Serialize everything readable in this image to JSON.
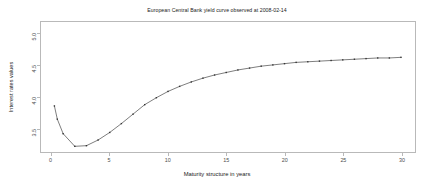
{
  "chart_data": {
    "type": "line",
    "title": "European Central Bank yield curve observed at 2008-02-14",
    "xlabel": "Maturity structure in years",
    "ylabel": "Interest rates values",
    "xlim": [
      -0.9,
      31.2
    ],
    "ylim": [
      3.12,
      5.18
    ],
    "xticks": [
      0,
      5,
      10,
      15,
      20,
      25,
      30
    ],
    "xticklabels": [
      "0",
      "5",
      "10",
      "15",
      "20",
      "25",
      "30"
    ],
    "yticks": [
      3.5,
      4.0,
      4.5,
      5.0
    ],
    "yticklabels": [
      "3.5",
      "4.0",
      "4.5",
      "5.0"
    ],
    "grid": false,
    "legend": false,
    "marker": "point",
    "line_color": "#444444",
    "marker_color": "#333333",
    "panel_border_color": "#b9b9b9",
    "background": "#ffffff",
    "series": [
      {
        "name": "yield curve",
        "x": [
          0.25,
          0.5,
          1,
          2,
          3,
          4,
          5,
          6,
          7,
          8,
          9,
          10,
          11,
          12,
          13,
          14,
          15,
          16,
          17,
          18,
          19,
          20,
          21,
          22,
          23,
          24,
          25,
          26,
          27,
          28,
          29,
          30
        ],
        "y": [
          3.85,
          3.64,
          3.41,
          3.21,
          3.22,
          3.31,
          3.43,
          3.57,
          3.72,
          3.87,
          3.98,
          4.08,
          4.16,
          4.23,
          4.29,
          4.34,
          4.38,
          4.42,
          4.45,
          4.48,
          4.5,
          4.52,
          4.54,
          4.55,
          4.56,
          4.57,
          4.58,
          4.59,
          4.6,
          4.61,
          4.61,
          4.62
        ]
      }
    ]
  }
}
